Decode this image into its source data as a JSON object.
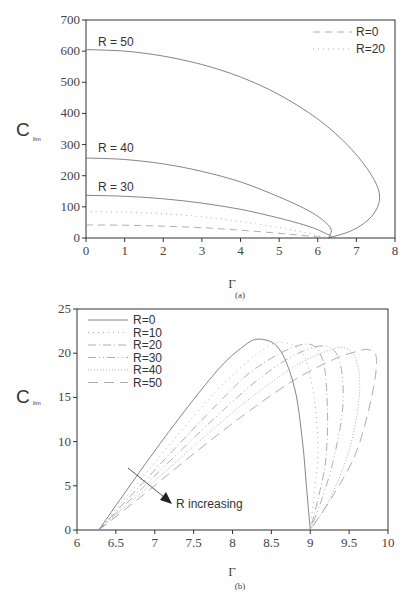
{
  "chart_data": [
    {
      "id": "a",
      "type": "line",
      "caption": "(a)",
      "xlabel": "Γ",
      "ylabel": "C",
      "ylabel_sub": "lim",
      "xlim": [
        0,
        8
      ],
      "ylim": [
        0,
        700
      ],
      "xticks": [
        0,
        1,
        2,
        3,
        4,
        5,
        6,
        7,
        8
      ],
      "yticks": [
        0,
        100,
        200,
        300,
        400,
        500,
        600,
        700
      ],
      "grid": false,
      "legend": {
        "position": "top-right",
        "entries": [
          {
            "label": "R=0",
            "style": "dashed"
          },
          {
            "label": "R=20",
            "style": "dotted"
          }
        ]
      },
      "annotations": [
        "R = 50",
        "R = 40",
        "R = 30"
      ],
      "series": [
        {
          "name": "R=0",
          "style": "dashed",
          "x": [
            0,
            1,
            2,
            3,
            4,
            5,
            5.8,
            6.28
          ],
          "y": [
            42,
            41,
            38,
            33,
            25,
            15,
            6,
            0
          ]
        },
        {
          "name": "R=20",
          "style": "dotted",
          "x": [
            0,
            1,
            2,
            3,
            4,
            5,
            5.8,
            6.28
          ],
          "y": [
            85,
            83,
            78,
            68,
            53,
            33,
            14,
            0
          ]
        },
        {
          "name": "R=30",
          "style": "solid",
          "x": [
            0,
            1,
            2,
            3,
            4,
            5,
            5.8,
            6.2,
            6.35,
            6.28
          ],
          "y": [
            137,
            134,
            126,
            112,
            92,
            64,
            36,
            15,
            5,
            0
          ]
        },
        {
          "name": "R=40",
          "style": "solid",
          "x": [
            0,
            1,
            2,
            3,
            4,
            5,
            5.8,
            6.2,
            6.35,
            6.28
          ],
          "y": [
            257,
            252,
            238,
            214,
            180,
            132,
            85,
            50,
            25,
            0
          ]
        },
        {
          "name": "R=50",
          "style": "solid",
          "x": [
            0,
            1,
            2,
            3,
            4,
            5,
            6,
            6.8,
            7.4,
            7.6,
            7.4,
            6.9,
            6.28
          ],
          "y": [
            605,
            600,
            584,
            557,
            517,
            460,
            382,
            295,
            200,
            130,
            70,
            25,
            0
          ]
        }
      ]
    },
    {
      "id": "b",
      "type": "line",
      "caption": "(b)",
      "xlabel": "Γ",
      "ylabel": "C",
      "ylabel_sub": "lim",
      "xlim": [
        6,
        10
      ],
      "ylim": [
        0,
        25
      ],
      "xticks": [
        6,
        6.5,
        7,
        7.5,
        8,
        8.5,
        9,
        9.5,
        10
      ],
      "yticks": [
        0,
        5,
        10,
        15,
        20,
        25
      ],
      "grid": false,
      "legend": {
        "position": "top-left",
        "entries": [
          {
            "label": "R=0",
            "style": "solid"
          },
          {
            "label": "R=10",
            "style": "dotted"
          },
          {
            "label": "R=20",
            "style": "dash-dot"
          },
          {
            "label": "R=30",
            "style": "dash-dot-dot"
          },
          {
            "label": "R=40",
            "style": "dense-dotted"
          },
          {
            "label": "R=50",
            "style": "long-dash"
          }
        ]
      },
      "annotations": [
        "R increasing"
      ],
      "series": [
        {
          "name": "R=0",
          "style": "solid",
          "x": [
            6.28,
            6.8,
            7.3,
            7.8,
            8.1,
            8.33,
            8.6,
            8.8,
            8.9,
            8.95,
            9.0
          ],
          "y": [
            0,
            6.5,
            12.5,
            18,
            20.5,
            21.6,
            20.5,
            16,
            10,
            5,
            0
          ]
        },
        {
          "name": "R=10",
          "style": "dotted",
          "x": [
            6.28,
            6.8,
            7.3,
            7.8,
            8.3,
            8.6,
            8.9,
            9.05,
            9.1,
            9.05,
            9.0
          ],
          "y": [
            0,
            5.5,
            10.8,
            15.8,
            19.8,
            21.2,
            20,
            15,
            9,
            4,
            0
          ]
        },
        {
          "name": "R=20",
          "style": "dash-dot",
          "x": [
            6.28,
            6.8,
            7.3,
            7.8,
            8.3,
            8.9,
            9.15,
            9.22,
            9.2,
            9.1,
            9.0
          ],
          "y": [
            0,
            4.9,
            9.6,
            14.2,
            18.3,
            21,
            19.5,
            14,
            8,
            3.5,
            0
          ]
        },
        {
          "name": "R=30",
          "style": "dash-dot-dot",
          "x": [
            6.28,
            6.8,
            7.3,
            7.8,
            8.3,
            8.8,
            9.2,
            9.38,
            9.42,
            9.3,
            9.15,
            9.0
          ],
          "y": [
            0,
            4.4,
            8.7,
            12.9,
            16.8,
            19.8,
            20.8,
            19,
            14,
            8,
            3.5,
            0
          ]
        },
        {
          "name": "R=40",
          "style": "dense-dotted",
          "x": [
            6.28,
            6.8,
            7.3,
            7.8,
            8.3,
            8.8,
            9.2,
            9.45,
            9.6,
            9.63,
            9.5,
            9.25,
            9.0
          ],
          "y": [
            0,
            4,
            7.9,
            11.8,
            15.4,
            18.5,
            20.2,
            20.6,
            19,
            15,
            9,
            3.5,
            0
          ]
        },
        {
          "name": "R=50",
          "style": "long-dash",
          "x": [
            6.28,
            6.8,
            7.3,
            7.8,
            8.3,
            8.8,
            9.3,
            9.6,
            9.75,
            9.85,
            9.8,
            9.6,
            9.3,
            9.0
          ],
          "y": [
            0,
            3.6,
            7.2,
            10.7,
            14,
            17,
            19.3,
            20.2,
            20.4,
            19.5,
            15.5,
            9,
            4,
            0
          ]
        }
      ]
    }
  ]
}
